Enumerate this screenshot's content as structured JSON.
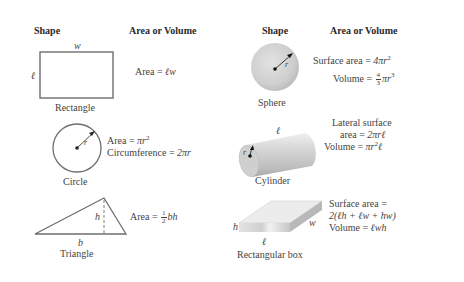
{
  "left_table": {
    "header_shape": "Shape",
    "header_formula": "Area or Volume",
    "rectangle": {
      "label": "Rectangle",
      "var_top": "w",
      "var_side": "ℓ",
      "formula_prefix": "Area = ",
      "formula_vars": "ℓw"
    },
    "circle": {
      "label": "Circle",
      "var_radius": "r",
      "area_prefix": "Area = ",
      "area_expr": "πr",
      "area_exp": "2",
      "circ_prefix": "Circumference = ",
      "circ_expr": "2πr"
    },
    "triangle": {
      "label": "Triangle",
      "var_base": "b",
      "var_height": "h",
      "formula_prefix": "Area = ",
      "frac_num": "1",
      "frac_den": "2",
      "formula_vars": "bh"
    }
  },
  "right_table": {
    "header_shape": "Shape",
    "header_formula": "Area or Volume",
    "sphere": {
      "label": "Sphere",
      "var_radius": "r",
      "surface_prefix": "Surface area = ",
      "surface_expr": "4πr",
      "surface_exp": "2",
      "volume_prefix": "Volume = ",
      "frac_num": "4",
      "frac_den": "3",
      "volume_expr": "πr",
      "volume_exp": "3"
    },
    "cylinder": {
      "label": "Cylinder",
      "var_radius": "r",
      "var_length": "ℓ",
      "lateral_line1": "Lateral surface",
      "lateral_prefix": "area = ",
      "lateral_expr": "2πrℓ",
      "volume_prefix": "Volume = ",
      "volume_expr_a": "πr",
      "volume_exp": "2",
      "volume_expr_b": "ℓ"
    },
    "box": {
      "label": "Rectangular box",
      "var_h": "h",
      "var_l": "ℓ",
      "var_w": "w",
      "surface_line1": "Surface area =",
      "surface_line2": "2(ℓh + ℓw + hw)",
      "volume_prefix": "Volume = ",
      "volume_expr": "ℓwh"
    }
  },
  "colors": {
    "line": "#6e6e6e",
    "text": "#444444",
    "solid_fill": "#d4d4d4"
  }
}
